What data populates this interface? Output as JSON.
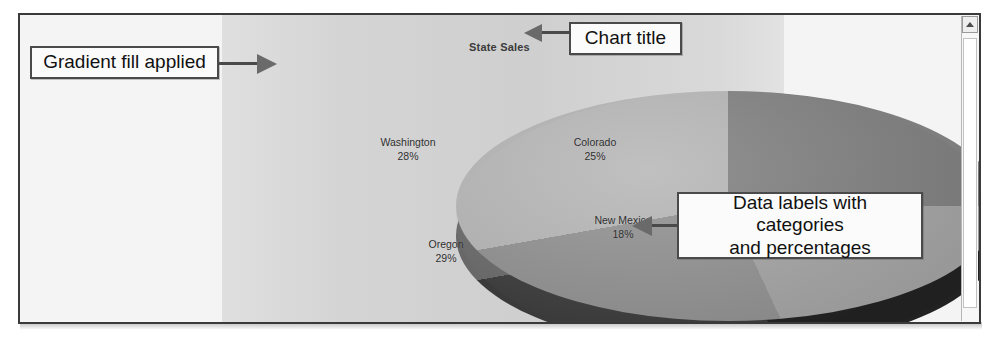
{
  "chart": {
    "title": "State Sales"
  },
  "annotations": [
    {
      "id": "gradient",
      "text": "Gradient fill applied"
    },
    {
      "id": "title",
      "text": "Chart title"
    },
    {
      "id": "datalabels",
      "line1": "Data labels with categories",
      "line2": "and percentages"
    }
  ],
  "scrollbar": {
    "up_arrow": "scroll-up-arrow"
  },
  "colors": {
    "colorado": "#7e7e7e",
    "new_mexico": "#a2a2a2",
    "oregon": "#8f8f8f",
    "washington": "#b4b4b4",
    "frame_border": "#3a3a3a",
    "callout_border": "#4a4a4a",
    "plot_gradient_start": "#dfdfdf",
    "plot_gradient_end": "#e2e2e2"
  },
  "chart_data": {
    "type": "pie",
    "title": "State Sales",
    "categories": [
      "Colorado",
      "New Mexico",
      "Oregon",
      "Washington"
    ],
    "values": [
      25,
      18,
      29,
      28
    ],
    "value_unit": "%",
    "labels": [
      {
        "category": "Colorado",
        "percent": "25%"
      },
      {
        "category": "New Mexico",
        "percent": "18%"
      },
      {
        "category": "Oregon",
        "percent": "29%"
      },
      {
        "category": "Washington",
        "percent": "28%"
      }
    ],
    "legend": false,
    "data_labels": "category name and percentage",
    "style": "3-D pie with gradient plot-area fill",
    "xlabel": "",
    "ylabel": ""
  }
}
